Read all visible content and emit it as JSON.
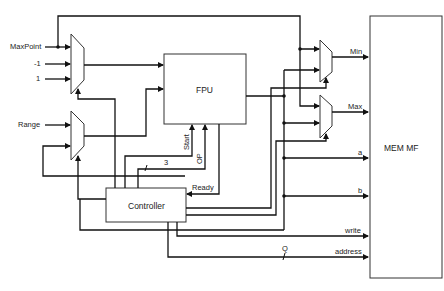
{
  "inputs": {
    "maxpoint": "MaxPoint",
    "minus_one": "-1",
    "one": "1",
    "range": "Range"
  },
  "blocks": {
    "fpu": "FPU",
    "controller": "Controller",
    "mem": "MEM MF"
  },
  "signals": {
    "start": "Start",
    "op": "OP",
    "op_width": "3",
    "ready": "Ready",
    "q_width": "Q"
  },
  "outputs": {
    "min": "Min",
    "max": "Max",
    "a": "a",
    "b": "b",
    "write": "write",
    "address": "address"
  },
  "colors": {
    "line": "#111111",
    "block_border": "#333333"
  }
}
